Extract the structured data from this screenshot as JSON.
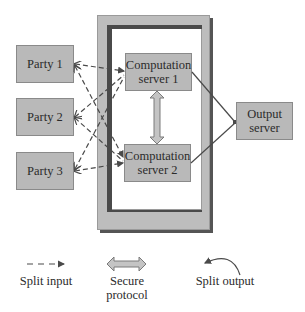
{
  "diagram": {
    "parties": [
      {
        "label": "Party 1"
      },
      {
        "label": "Party 2"
      },
      {
        "label": "Party 3"
      }
    ],
    "computation_servers": [
      {
        "label": "Computation server 1",
        "line1": "Computation",
        "line2": "server 1"
      },
      {
        "label": "Computation server 2",
        "line1": "Computation",
        "line2": "server 2"
      }
    ],
    "output_server": {
      "label": "Output server",
      "line1": "Output",
      "line2": "server"
    },
    "edges": [
      {
        "from": "Party 1",
        "to": "Computation server 1",
        "type": "split-input"
      },
      {
        "from": "Party 1",
        "to": "Computation server 2",
        "type": "split-input"
      },
      {
        "from": "Party 2",
        "to": "Computation server 1",
        "type": "split-input"
      },
      {
        "from": "Party 2",
        "to": "Computation server 2",
        "type": "split-input"
      },
      {
        "from": "Party 3",
        "to": "Computation server 1",
        "type": "split-input"
      },
      {
        "from": "Party 3",
        "to": "Computation server 2",
        "type": "split-input"
      },
      {
        "from": "Computation server 1",
        "to": "Computation server 2",
        "type": "secure-protocol"
      },
      {
        "from": "Computation server 1",
        "to": "Output server",
        "type": "split-output"
      },
      {
        "from": "Computation server 2",
        "to": "Output server",
        "type": "split-output"
      }
    ],
    "colors": {
      "box_fill": "#b9b9b9",
      "box_border": "#8a8a8a",
      "frame_light": "#bdbdbd",
      "frame_dark": "#4a4a4a",
      "line": "#4a4a4a",
      "arrow_fill": "#c4c4c4"
    }
  },
  "legend": {
    "split_input": {
      "label": "Split input",
      "icon": "dashed-arrow-icon"
    },
    "secure_protocol": {
      "label": "Secure protocol",
      "line1": "Secure",
      "line2": "protocol",
      "icon": "double-arrow-icon"
    },
    "split_output": {
      "label": "Split output",
      "icon": "curved-arrow-icon"
    }
  }
}
